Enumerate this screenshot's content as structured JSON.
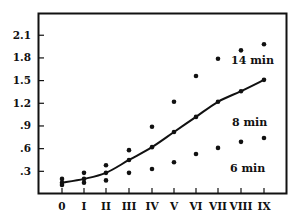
{
  "chart_data": {
    "type": "scatter",
    "title": "",
    "xlabel": "",
    "ylabel": "",
    "categories": [
      "0",
      "I",
      "II",
      "III",
      "IV",
      "V",
      "VI",
      "VII",
      "VIII",
      "IX"
    ],
    "yticks": [
      ".3",
      ".6",
      ".9",
      "1.2",
      "1.5",
      "1.8",
      "2.1"
    ],
    "ylim": [
      0,
      2.35
    ],
    "grid": false,
    "legend": "inline labels",
    "series": [
      {
        "name": "14 min",
        "style": "points",
        "values": [
          0.2,
          0.28,
          0.38,
          0.58,
          0.89,
          1.22,
          1.56,
          1.79,
          1.9,
          1.98
        ]
      },
      {
        "name": "8 min",
        "style": "line-with-points",
        "values": [
          0.15,
          0.2,
          0.28,
          0.45,
          0.62,
          0.82,
          1.02,
          1.22,
          1.36,
          1.51
        ]
      },
      {
        "name": "6 min",
        "style": "points",
        "values": [
          0.12,
          0.15,
          0.18,
          0.28,
          0.33,
          0.42,
          0.53,
          0.61,
          0.69,
          0.74
        ]
      }
    ],
    "annotations": [
      {
        "text": "14 min",
        "near": "VIII"
      },
      {
        "text": "8 min",
        "near": "VIII"
      },
      {
        "text": "6 min",
        "near": "VIII"
      }
    ]
  },
  "colors": {
    "ink": "#111111",
    "background": "#ffffff"
  }
}
